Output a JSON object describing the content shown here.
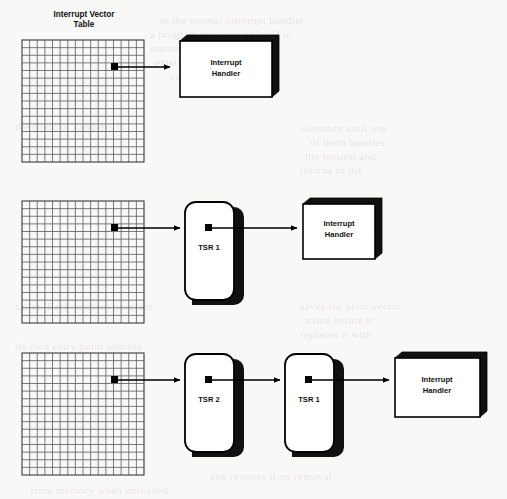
{
  "figure": {
    "background_color": "#f8f8f6",
    "ink_color": "#000000",
    "grid_line_color": "#5b5b5b"
  },
  "labels": {
    "ivt_title_line1": "Interrupt Vector",
    "ivt_title_line2": "Table",
    "interrupt_handler_line1": "Interrupt",
    "interrupt_handler_line2": "Handler",
    "tsr1": "TSR 1",
    "tsr2": "TSR 2"
  },
  "rows": [
    {
      "id": "row-1",
      "title_shown": true,
      "chain": [
        "interrupt-vector-table",
        "interrupt-handler"
      ]
    },
    {
      "id": "row-2",
      "title_shown": false,
      "chain": [
        "interrupt-vector-table",
        "tsr1",
        "interrupt-handler"
      ]
    },
    {
      "id": "row-3",
      "title_shown": false,
      "chain": [
        "interrupt-vector-table",
        "tsr2",
        "tsr1",
        "interrupt-handler"
      ]
    }
  ],
  "grid": {
    "columns": 16,
    "rows": 16,
    "vector_marker_col": 13,
    "vector_marker_row": 4
  },
  "background_bleed": [
    {
      "x": 160,
      "y": 14,
      "text": "to the normal interrupt handler"
    },
    {
      "x": 150,
      "y": 28,
      "text": "a program may install itself in"
    },
    {
      "x": 150,
      "y": 42,
      "text": "memory and chain onto the"
    },
    {
      "x": 155,
      "y": 56,
      "text": "existing vector so that"
    },
    {
      "x": 170,
      "y": 70,
      "text": "control passes along"
    },
    {
      "x": 15,
      "y": 120,
      "text": "the chain of handlers in"
    },
    {
      "x": 300,
      "y": 122,
      "text": "sequence until one"
    },
    {
      "x": 310,
      "y": 136,
      "text": "of them handles"
    },
    {
      "x": 305,
      "y": 150,
      "text": "the request and"
    },
    {
      "x": 300,
      "y": 164,
      "text": "returns to the"
    },
    {
      "x": 15,
      "y": 300,
      "text": "caller. Each resident program"
    },
    {
      "x": 300,
      "y": 300,
      "text": "saves the prior vector"
    },
    {
      "x": 305,
      "y": 314,
      "text": "value before it"
    },
    {
      "x": 300,
      "y": 328,
      "text": "replaces it with"
    },
    {
      "x": 15,
      "y": 340,
      "text": "its own entry point address"
    },
    {
      "x": 210,
      "y": 470,
      "text": "and restores it on removal"
    },
    {
      "x": 30,
      "y": 484,
      "text": "from memory when unloaded"
    }
  ]
}
